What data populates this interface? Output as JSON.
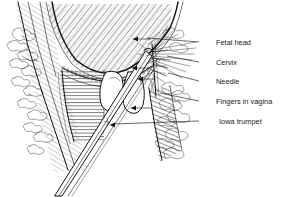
{
  "figure": {
    "background_color": "#ffffff",
    "ink_color": "#141414",
    "width": 289,
    "height": 197
  },
  "labels": [
    {
      "id": "fetal-head",
      "text": "Fetal head",
      "text_x": 216,
      "text_y": 45,
      "leader_x1": 199,
      "leader_y1": 42,
      "leader_x2": 147,
      "leader_y2": 38
    },
    {
      "id": "cervix",
      "text": "Cervix",
      "text_x": 216,
      "text_y": 65,
      "leader_x1": 199,
      "leader_y1": 62,
      "leader_x2": 167,
      "leader_y2": 56
    },
    {
      "id": "needle",
      "text": "Needle",
      "text_x": 216,
      "text_y": 84,
      "leader_x1": 199,
      "leader_y1": 81,
      "leader_x2": 168,
      "leader_y2": 73
    },
    {
      "id": "fingers-in-vagina",
      "text": "Fingers in vagina",
      "text_x": 216,
      "text_y": 104,
      "leader_x1": 199,
      "leader_y1": 101,
      "leader_x2": 160,
      "leader_y2": 93
    },
    {
      "id": "iowa-trumpet",
      "text": "Iowa trumpet",
      "text_x": 219,
      "text_y": 124,
      "leader_x1": 199,
      "leader_y1": 121,
      "leader_x2": 113,
      "leader_y2": 124
    }
  ],
  "structures": [
    {
      "id": "fetal-head",
      "name": "Fetal head",
      "rendering": "large curved U-shaped mass with dense diagonal hatching, upper center"
    },
    {
      "id": "uterine-wall",
      "name": "Uterine / pelvic wall",
      "rendering": "curved double contour lines at left with diagonal hatching"
    },
    {
      "id": "fat-tissue-left",
      "name": "Adipose tissue (left)",
      "rendering": "scalloped cloud-like cluster outlines along left margin"
    },
    {
      "id": "fat-tissue-right",
      "name": "Adipose tissue (right)",
      "rendering": "scalloped cloud-like cluster outlines along right of needle"
    },
    {
      "id": "cervix",
      "name": "Cervix",
      "rendering": "thin stippled band beneath fetal head, center"
    },
    {
      "id": "vaginal-wall",
      "name": "Vaginal wall",
      "rendering": "vertical block with horizontal hatching, left of center"
    },
    {
      "id": "fingers",
      "name": "Fingers in vagina",
      "rendering": "two white outlined fingertip ovals, center"
    },
    {
      "id": "needle",
      "name": "Needle",
      "rendering": "fine line with radiating spray of anesthetic lines, right of center"
    },
    {
      "id": "iowa-trumpet",
      "name": "Iowa trumpet",
      "rendering": "long double-line tube running diagonally from lower-left to center"
    }
  ],
  "arrows": [
    {
      "id": "arrow-upper",
      "direction": "left",
      "x": 140,
      "y": 39
    },
    {
      "id": "arrow-mid",
      "direction": "left",
      "x": 140,
      "y": 68
    },
    {
      "id": "arrow-lower",
      "direction": "left",
      "x": 146,
      "y": 79
    },
    {
      "id": "arrow-finger",
      "direction": "left",
      "x": 137,
      "y": 108
    },
    {
      "id": "arrow-trumpet",
      "direction": "left",
      "x": 112,
      "y": 125
    }
  ]
}
